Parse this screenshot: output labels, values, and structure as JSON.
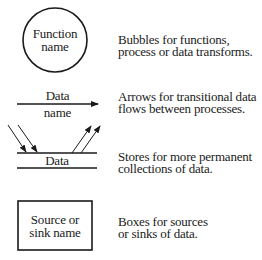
{
  "legend": {
    "process": {
      "symbol": "circle",
      "label_lines": [
        "Function",
        "name"
      ],
      "description_lines": [
        "Bubbles for functions,",
        "process or data transforms."
      ]
    },
    "data_flow": {
      "symbol": "arrow",
      "label_top": "Data",
      "label_bottom": "name",
      "description_lines": [
        "Arrows for transitional data",
        "flows between processes."
      ]
    },
    "data_store": {
      "symbol": "parallel-lines",
      "label": "Data",
      "description_lines": [
        "Stores for more permanent",
        "collections of data."
      ]
    },
    "external_entity": {
      "symbol": "rectangle",
      "label_lines": [
        "Source or",
        "sink name"
      ],
      "description_lines": [
        "Boxes for sources",
        "or sinks of data."
      ]
    }
  },
  "colors": {
    "ink": "#1a1a1a",
    "background": "#ffffff"
  }
}
